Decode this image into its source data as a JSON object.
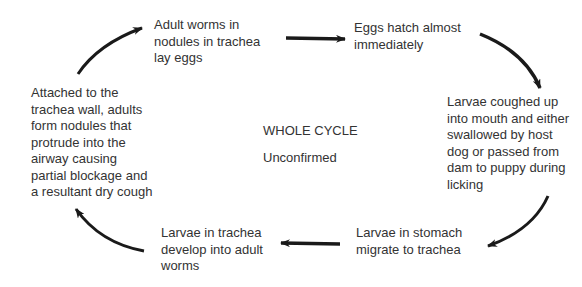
{
  "diagram": {
    "type": "life-cycle",
    "center": {
      "title": "WHOLE CYCLE",
      "subtitle": "Unconfirmed"
    },
    "nodes": [
      {
        "id": "adult-worms-lay-eggs",
        "text": "Adult worms in\nnodules in trachea\nlay eggs"
      },
      {
        "id": "eggs-hatch",
        "text": "Eggs hatch almost\nimmediately"
      },
      {
        "id": "larvae-coughed-up",
        "text": "Larvae coughed up\ninto mouth and either\nswallowed by host\ndog or passed from\ndam to puppy during\nlicking"
      },
      {
        "id": "larvae-migrate",
        "text": "Larvae in stomach\nmigrate to trachea"
      },
      {
        "id": "larvae-develop",
        "text": "Larvae in trachea\ndevelop into adult\nworms"
      },
      {
        "id": "adults-form-nodules",
        "text": "Attached to the\ntrachea wall, adults\nform nodules that\nprotrude into the\nairway causing\npartial blockage and\na resultant dry cough"
      }
    ],
    "edges": [
      {
        "from": "adult-worms-lay-eggs",
        "to": "eggs-hatch",
        "shape": "straight"
      },
      {
        "from": "eggs-hatch",
        "to": "larvae-coughed-up",
        "shape": "curved"
      },
      {
        "from": "larvae-coughed-up",
        "to": "larvae-migrate",
        "shape": "curved"
      },
      {
        "from": "larvae-migrate",
        "to": "larvae-develop",
        "shape": "straight"
      },
      {
        "from": "larvae-develop",
        "to": "adults-form-nodules",
        "shape": "curved"
      },
      {
        "from": "adults-form-nodules",
        "to": "adult-worms-lay-eggs",
        "shape": "curved"
      }
    ],
    "colors": {
      "text": "#333333",
      "arrow": "#1a1a1a",
      "background": "#ffffff"
    }
  }
}
